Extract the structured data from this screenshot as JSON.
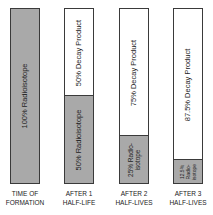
{
  "diagram": {
    "stages": [
      {
        "caption_line1": "TIME OF",
        "caption_line2": "FORMATION",
        "radioisotope_pct": 100,
        "radioisotope_label": "100% Radioisotope",
        "decay_label": ""
      },
      {
        "caption_line1": "AFTER 1",
        "caption_line2": "HALF-LIFE",
        "radioisotope_pct": 50,
        "radioisotope_label": "50% Radioisotope",
        "decay_label": "50% Decay Product"
      },
      {
        "caption_line1": "AFTER 2",
        "caption_line2": "HALF-LIVES",
        "radioisotope_pct": 25,
        "radioisotope_label_line1": "25% Radio-",
        "radioisotope_label_line2": "isotope",
        "decay_label": "75% Decay Product"
      },
      {
        "caption_line1": "AFTER 3",
        "caption_line2": "HALF-LIVES",
        "radioisotope_pct": 12.5,
        "radioisotope_label_line1": "12.5%",
        "radioisotope_label_line2": "Radio-",
        "radioisotope_label_line3": "isotope",
        "decay_label": "87.5% Decay Product"
      }
    ],
    "colors": {
      "radioisotope": "#a9a9a9",
      "decay_product": "#ffffff",
      "border": "#3a3a3a"
    }
  }
}
